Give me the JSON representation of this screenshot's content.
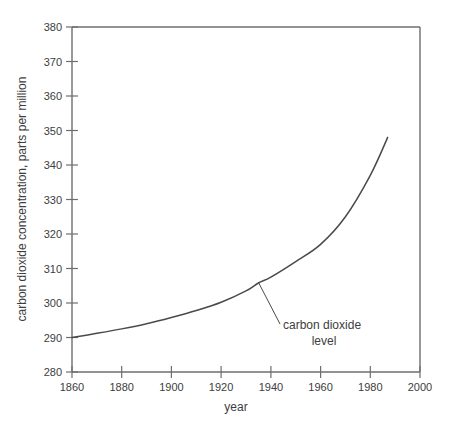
{
  "chart_data": {
    "type": "line",
    "title": "",
    "xlabel": "year",
    "ylabel": "carbon dioxide concentration, parts per million",
    "xlim": [
      1860,
      2000
    ],
    "ylim": [
      280,
      380
    ],
    "grid": false,
    "legend": "none",
    "x_ticks": [
      1860,
      1880,
      1900,
      1920,
      1940,
      1960,
      1980,
      2000
    ],
    "y_ticks": [
      280,
      290,
      300,
      310,
      320,
      330,
      340,
      350,
      360,
      370,
      380
    ],
    "x_tick_labels": [
      "1860",
      "1880",
      "1900",
      "1920",
      "1940",
      "1960",
      "1980",
      "2000"
    ],
    "y_tick_labels": [
      "280",
      "290",
      "300",
      "310",
      "320",
      "330",
      "340",
      "350",
      "360",
      "370",
      "380"
    ],
    "series": [
      {
        "name": "carbon dioxide level",
        "color": "#4a4a4a",
        "x": [
          1860,
          1870,
          1880,
          1890,
          1900,
          1910,
          1920,
          1930,
          1935,
          1940,
          1950,
          1960,
          1970,
          1980,
          1987
        ],
        "values": [
          290.0,
          291.2,
          292.5,
          294.0,
          295.8,
          297.8,
          300.2,
          303.5,
          305.8,
          307.5,
          312.0,
          317.0,
          325.0,
          337.0,
          348.0
        ]
      }
    ],
    "annotations": [
      {
        "name": "carbon-dioxide-level-callout",
        "lines": [
          "carbon dioxide",
          "level"
        ],
        "point_x": 1935,
        "point_y": 306
      }
    ]
  },
  "axis": {
    "x_title": "year",
    "y_title": "carbon dioxide concentration, parts per million"
  },
  "annotation": {
    "line1": "carbon dioxide",
    "line2": "level"
  },
  "ticks": {
    "x": [
      "1860",
      "1880",
      "1900",
      "1920",
      "1940",
      "1960",
      "1980",
      "2000"
    ],
    "y": [
      "280",
      "290",
      "300",
      "310",
      "320",
      "330",
      "340",
      "350",
      "360",
      "370",
      "380"
    ]
  },
  "colors": {
    "curve": "#4a4a4a",
    "axis": "#6e6e6e",
    "text": "#3d3d3d",
    "background": "#ffffff"
  }
}
